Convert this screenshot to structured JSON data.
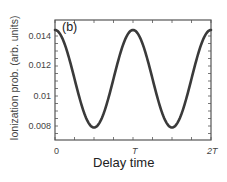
{
  "chart_data": {
    "type": "line",
    "title": "",
    "panel_label": "(b)",
    "xlabel": "Delay time",
    "ylabel": "Ionization prob. (arb. units)",
    "x_ticks": [
      "0",
      "T",
      "2T"
    ],
    "y_ticks": [
      "0.014",
      "0.012",
      "0.01",
      "0.008"
    ],
    "xlim": [
      0,
      2
    ],
    "ylim": [
      0.007,
      0.0145
    ],
    "grid": false,
    "legend": null,
    "series": [
      {
        "name": "Ionization probability",
        "color": "#3a3a3a",
        "x": [
          0,
          0.1,
          0.2,
          0.3,
          0.4,
          0.5,
          0.6,
          0.7,
          0.8,
          0.9,
          1.0,
          1.1,
          1.2,
          1.3,
          1.4,
          1.5,
          1.6,
          1.7,
          1.8,
          1.9,
          2.0
        ],
        "y": [
          0.0144,
          0.014,
          0.013,
          0.0113,
          0.0096,
          0.0082,
          0.0079,
          0.0084,
          0.0099,
          0.0116,
          0.0144,
          0.014,
          0.013,
          0.0113,
          0.0096,
          0.0082,
          0.0079,
          0.0084,
          0.0099,
          0.0116,
          0.0144
        ]
      }
    ]
  }
}
